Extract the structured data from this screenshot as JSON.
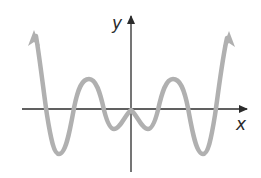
{
  "figure": {
    "x_axis_label": "x",
    "y_axis_label": "y",
    "curve_color": "#b0b0b0",
    "axis_color": "#2b2b2b"
  },
  "curve": {
    "left_end": "arrow up",
    "right_end": "arrow up",
    "turning_points": [
      {
        "type": "min",
        "position": "far left"
      },
      {
        "type": "max",
        "position": "left"
      },
      {
        "type": "min",
        "position": "inner left"
      },
      {
        "type": "max",
        "position": "origin"
      },
      {
        "type": "min",
        "position": "inner right"
      },
      {
        "type": "max",
        "position": "right"
      },
      {
        "type": "min",
        "position": "far right"
      }
    ],
    "x_intercepts_count": 7
  }
}
